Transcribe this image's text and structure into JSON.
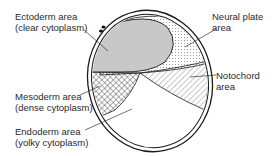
{
  "diagram": {
    "labels": {
      "ectoderm": {
        "line1": "Ectoderm area",
        "line2": "(clear cytoplasm)"
      },
      "neural_plate": {
        "line1": "Neural plate",
        "line2": "area"
      },
      "notochord": {
        "line1": "Notochord",
        "line2": "area"
      },
      "mesoderm": {
        "line1": "Mesoderm area",
        "line2": "(dense cytoplasm)"
      },
      "endoderm": {
        "line1": "Endoderm area",
        "line2": "(yolky cytoplasm)"
      }
    },
    "colors": {
      "outline": "#1a1a1a",
      "ectoderm_fill": "#c8c8c8",
      "text": "#2a2a2a"
    }
  }
}
